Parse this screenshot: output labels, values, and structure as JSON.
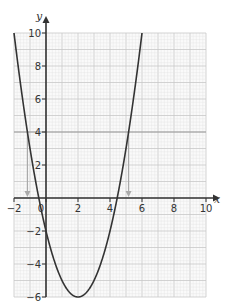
{
  "chart_data": {
    "type": "line",
    "title": "",
    "xlabel": "x",
    "ylabel": "y",
    "xlim": [
      -2,
      10
    ],
    "ylim": [
      -6,
      10
    ],
    "x_ticks": [
      -2,
      0,
      2,
      4,
      6,
      8,
      10
    ],
    "x_tick_labels": [
      "-2",
      "0",
      "2",
      "4",
      "6",
      "8",
      "10"
    ],
    "y_ticks": [
      -6,
      -4,
      -2,
      2,
      4,
      6,
      8,
      10
    ],
    "y_tick_labels": [
      "-6",
      "-4",
      "-2",
      "2",
      "4",
      "6",
      "8",
      "10"
    ],
    "grid": true,
    "series": [
      {
        "name": "y = x^2 - 4x - 2",
        "kind": "parabola",
        "a": 1,
        "b": -4,
        "c": -2,
        "vertex": [
          2,
          -6
        ],
        "roots": [
          -0.45,
          4.45
        ]
      },
      {
        "name": "y = 4",
        "kind": "horizontal-line",
        "y": 4
      }
    ],
    "annotations": [
      {
        "type": "arrow-down",
        "x": -1.16,
        "from_y": 4,
        "to_y": 0
      },
      {
        "type": "arrow-down",
        "x": 5.16,
        "from_y": 4,
        "to_y": 0
      }
    ]
  },
  "colors": {
    "curve": "#333333",
    "line": "#999999",
    "grid_minor": "#e2e2e2",
    "grid_major": "#c8c8c8",
    "axis": "#333333",
    "arrow": "#aaaaaa"
  }
}
